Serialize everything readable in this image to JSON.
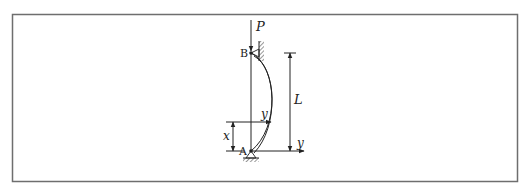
{
  "figure": {
    "type": "buckled column diagram",
    "frame": {
      "stroke": "#6e6e6e"
    },
    "colors": {
      "line": "#222222",
      "frame": "#6e6e6e",
      "background": "#ffffff"
    },
    "labels": {
      "load": "P",
      "top_pin": "B",
      "bottom_pin": "A",
      "length": "L",
      "deflection": "y",
      "axis_y": "y",
      "position": "x"
    }
  }
}
